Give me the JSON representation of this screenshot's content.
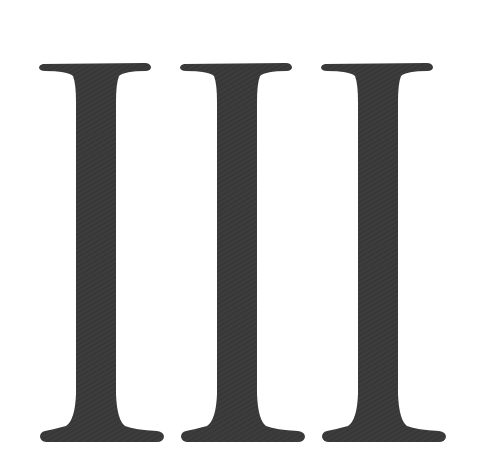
{
  "numeral": {
    "text": "III",
    "value": 3,
    "fill": "#3b3b3b",
    "background": "#ffffff"
  }
}
